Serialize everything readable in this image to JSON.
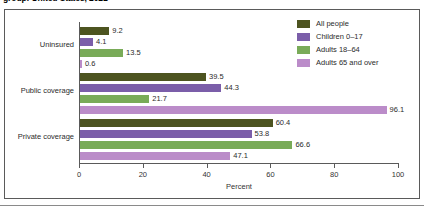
{
  "title": "group: United States, 2021",
  "legend": {
    "position": "top-right",
    "items": [
      {
        "label": "All people",
        "color": "#4d5420"
      },
      {
        "label": "Children 0–17",
        "color": "#7b5ea9"
      },
      {
        "label": "Adults 18–64",
        "color": "#79ab58"
      },
      {
        "label": "Adults 65 and over",
        "color": "#bb8cc9"
      }
    ]
  },
  "axis": {
    "xlabel": "Percent",
    "ticks": [
      "0",
      "20",
      "40",
      "60",
      "80",
      "100"
    ],
    "tick_values": [
      0,
      20,
      40,
      60,
      80,
      100
    ],
    "xmin": 0,
    "xmax": 100
  },
  "chart_data": {
    "type": "bar",
    "orientation": "horizontal",
    "title": "group: United States, 2021",
    "xlabel": "Percent",
    "ylabel": "",
    "xlim": [
      0,
      100
    ],
    "grid": false,
    "legend_position": "top-right",
    "categories": [
      "Uninsured",
      "Public coverage",
      "Private coverage"
    ],
    "series": [
      {
        "name": "All people",
        "color": "#4d5420",
        "values": [
          9.2,
          39.5,
          60.4
        ]
      },
      {
        "name": "Children 0–17",
        "color": "#7b5ea9",
        "values": [
          4.1,
          44.3,
          53.8
        ]
      },
      {
        "name": "Adults 18–64",
        "color": "#79ab58",
        "values": [
          13.5,
          21.7,
          66.6
        ]
      },
      {
        "name": "Adults 65 and over",
        "color": "#bb8cc9",
        "values": [
          0.6,
          96.1,
          47.1
        ]
      }
    ],
    "data_labels": [
      [
        "9.2",
        "4.1",
        "13.5",
        "0.6"
      ],
      [
        "39.5",
        "44.3",
        "21.7",
        "96.1"
      ],
      [
        "60.4",
        "53.8",
        "66.6",
        "47.1"
      ]
    ]
  }
}
